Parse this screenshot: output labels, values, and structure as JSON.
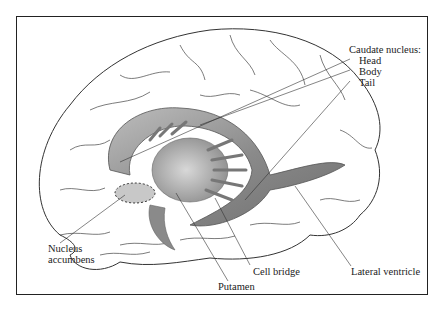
{
  "figure": {
    "labels": {
      "caudate_title": "Caudate nucleus:",
      "head": "Head",
      "body": "Body",
      "tail": "Tail",
      "nucleus_accumbens_line1": "Nucleus",
      "nucleus_accumbens_line2": "accumbens",
      "putamen": "Putamen",
      "cell_bridge": "Cell bridge",
      "lateral_ventricle": "Lateral ventricle"
    },
    "colors": {
      "frame": "#222222",
      "outline": "#333333",
      "structure_shading": "#8a8a8a",
      "background": "#ffffff"
    }
  }
}
